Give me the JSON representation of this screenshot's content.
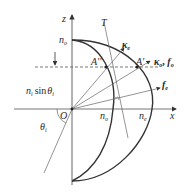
{
  "diagram": {
    "type": "index-ellipsoid-refraction",
    "axes": {
      "z_label": "z",
      "x_label": "x",
      "origin_label": "O"
    },
    "labels": {
      "n_o_z": {
        "base": "n",
        "sub": "o"
      },
      "n_o_x": {
        "base": "n",
        "sub": "o"
      },
      "n_e_x": {
        "base": "n",
        "sub": "e"
      },
      "tangent": "T",
      "A_double": "A''",
      "A_single": "A'",
      "kappa_e": {
        "base": "κ",
        "sub": "e"
      },
      "kappa_o_f_o": {
        "k": "κ",
        "k_sub": "o",
        "sep": ", ",
        "f": "f",
        "f_sub": "o"
      },
      "f_e": {
        "base": "f",
        "sub": "e"
      },
      "boundary": {
        "n": "n",
        "n_sub": "i",
        "fn": "sin",
        "theta": "θ",
        "theta_sub": "i"
      },
      "incidence_angle": {
        "base": "θ",
        "sub": "i"
      }
    },
    "colors": {
      "stroke": "#333333",
      "text": "#2a2a2a",
      "background": "#ffffff"
    }
  }
}
